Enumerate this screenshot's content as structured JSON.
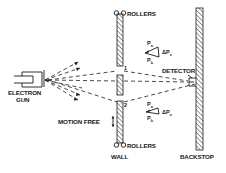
{
  "diagram": {
    "labels": {
      "electron_gun_line1": "ELECTRON",
      "electron_gun_line2": "GUN",
      "rollers_top": "ROLLERS",
      "rollers_bottom": "ROLLERS",
      "detector": "DETECTOR",
      "motion_free": "MOTION FREE",
      "wall": "WALL",
      "backstop": "BACKSTOP",
      "slit_1": "1",
      "slit_2": "2"
    },
    "momentum_top": {
      "pa": "P",
      "pa_sub": "a",
      "pb": "P",
      "pb_sub": "b",
      "dp": "ΔP",
      "dp_sub": "x"
    },
    "momentum_bottom": {
      "pa": "P",
      "pa_sub": "a",
      "pb": "P",
      "pb_sub": "b",
      "dp": "ΔP",
      "dp_sub": "x"
    },
    "colors": {
      "ink": "#1a1a1a",
      "background": "#ffffff"
    }
  }
}
